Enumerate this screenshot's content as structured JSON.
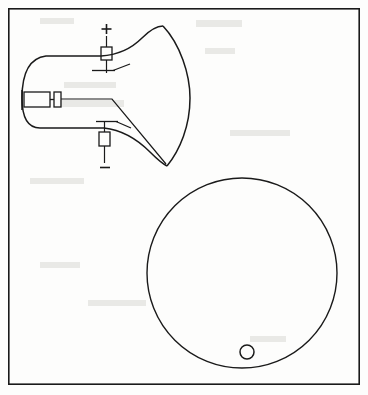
{
  "figure": {
    "title": "Cathode ray tube with electrostatic deflection and screen face view",
    "background_color": "#fdfdfc",
    "ink_color": "#1a1a1a",
    "width": 368,
    "height": 395
  },
  "frame": {
    "label": "figure-border",
    "x": 8,
    "y": 8,
    "width": 352,
    "height": 377,
    "stroke_width": 1.6
  },
  "crt": {
    "label": "cathode-ray-tube",
    "envelope": {
      "neck_left_x": 22,
      "neck_top_y": 56,
      "neck_bottom_y": 128,
      "screen_top_x": 163,
      "screen_top_y": 26,
      "screen_bottom_x": 167,
      "screen_bottom_y": 166
    },
    "electron_gun": {
      "label": "electron-gun",
      "x": 24,
      "y": 92,
      "width": 26,
      "height": 15
    },
    "anode_block": {
      "label": "anode-aperture",
      "x": 54,
      "y": 92,
      "width": 7,
      "height": 15
    },
    "plates": [
      {
        "label": "upper-deflection-plate",
        "polarity": "+",
        "box_x": 101,
        "box_y": 47,
        "box_width": 11,
        "box_height": 13,
        "lead_top_y": 36,
        "lead_bottom_y": 73
      },
      {
        "label": "lower-deflection-plate",
        "polarity": "−",
        "box_x": 99,
        "box_y": 132,
        "box_width": 11,
        "box_height": 14,
        "lead_top_y": 121,
        "lead_bottom_y": 163
      }
    ],
    "beam": {
      "label": "electron-beam",
      "start_x": 61,
      "start_y": 99,
      "bend_x": 112,
      "bend_y": 99,
      "end_x": 166,
      "end_y": 164
    }
  },
  "screen_face": {
    "label": "screen-face-view",
    "center_x": 242,
    "center_y": 273,
    "radius": 95,
    "spot": {
      "label": "beam-spot",
      "center_x": 247,
      "center_y": 352,
      "radius": 7
    }
  }
}
